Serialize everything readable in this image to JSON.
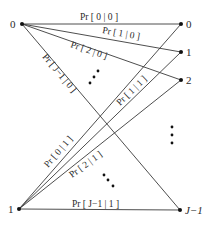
{
  "diagram": {
    "type": "channel transition diagram",
    "inputs": [
      {
        "label": "0",
        "x": 22,
        "y": 24
      },
      {
        "label": "1",
        "x": 19,
        "y": 209
      }
    ],
    "outputs": [
      {
        "label": "0",
        "x": 181,
        "y": 24
      },
      {
        "label": "1",
        "x": 181,
        "y": 52
      },
      {
        "label": "2",
        "x": 181,
        "y": 80
      },
      {
        "label": "J−1",
        "x": 180,
        "y": 210
      }
    ],
    "edges": [
      {
        "from": 0,
        "to": 0,
        "label": "Pr [ 0 | 0 ]"
      },
      {
        "from": 0,
        "to": 1,
        "label": "Pr [ 1 | 0 ]"
      },
      {
        "from": 0,
        "to": 2,
        "label": "Pr [ 2 | 0 ]"
      },
      {
        "from": 0,
        "to": 3,
        "label": "Pr [ J−1 | 0 ]"
      },
      {
        "from": 1,
        "to": 0,
        "label": "Pr [ 0 | 1 ]"
      },
      {
        "from": 1,
        "to": 1,
        "label": "Pr [ 1 | 1 ]"
      },
      {
        "from": 1,
        "to": 2,
        "label": "Pr [ 2 | 1 ]"
      },
      {
        "from": 1,
        "to": 3,
        "label": "Pr [ J−1 | 1 ]"
      }
    ],
    "ellipses": [
      "upper-middle-dots",
      "lower-middle-dots",
      "right-output-dots"
    ]
  }
}
